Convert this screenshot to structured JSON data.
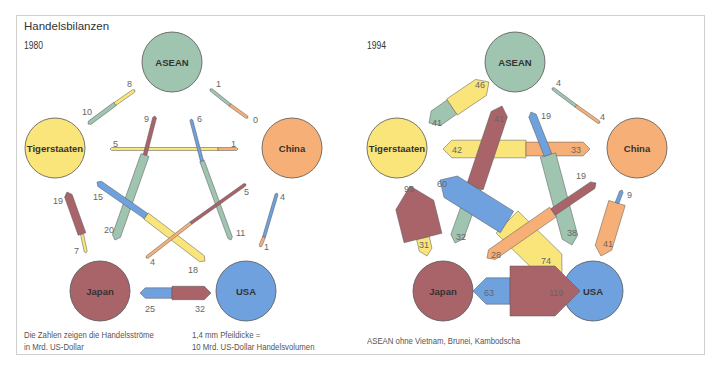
{
  "title": "Handelsbilanzen",
  "colors": {
    "ASEAN": "#9fc4b0",
    "Tigerstaaten": "#f9e57a",
    "China": "#f6b077",
    "Japan": "#a9646a",
    "USA": "#6fa1de",
    "stroke": "#555555",
    "text": "#333333",
    "label": "#666666"
  },
  "panels": [
    {
      "year": "1980",
      "nodes": [
        {
          "name": "ASEAN",
          "x": 172,
          "y": 62,
          "r": 30
        },
        {
          "name": "Tigerstaaten",
          "x": 55,
          "y": 148,
          "r": 30
        },
        {
          "name": "China",
          "x": 292,
          "y": 148,
          "r": 30
        },
        {
          "name": "Japan",
          "x": 100,
          "y": 291,
          "r": 30
        },
        {
          "name": "USA",
          "x": 246,
          "y": 291,
          "r": 30
        }
      ],
      "flows": [
        {
          "from": "ASEAN",
          "to": "Tigerstaaten",
          "value": 10,
          "x1": 88,
          "y1": 124,
          "x2": 115,
          "y2": 104,
          "label_pos": [
            82,
            115
          ]
        },
        {
          "from": "Tigerstaaten",
          "to": "ASEAN",
          "value": 8,
          "x1": 115,
          "y1": 104,
          "x2": 135,
          "y2": 90,
          "label_pos": [
            127,
            87
          ]
        },
        {
          "from": "ASEAN",
          "to": "China",
          "value": 1,
          "x1": 210,
          "y1": 89,
          "x2": 230,
          "y2": 105,
          "label_pos": [
            216,
            87
          ]
        },
        {
          "from": "China",
          "to": "ASEAN",
          "value": 0,
          "x1": 230,
          "y1": 105,
          "x2": 248,
          "y2": 118,
          "label_pos": [
            253,
            123
          ]
        },
        {
          "from": "Tigerstaaten",
          "to": "China",
          "value": 5,
          "x1": 110,
          "y1": 149,
          "x2": 218,
          "y2": 149,
          "label_pos": [
            113,
            147
          ]
        },
        {
          "from": "China",
          "to": "Tigerstaaten",
          "value": 1,
          "x1": 218,
          "y1": 149,
          "x2": 238,
          "y2": 149,
          "label_pos": [
            231,
            147
          ]
        },
        {
          "from": "ASEAN",
          "to": "Japan",
          "value": 20,
          "x1": 115,
          "y1": 240,
          "x2": 145,
          "y2": 155,
          "label_pos": [
            104,
            233
          ]
        },
        {
          "from": "Japan",
          "to": "ASEAN",
          "value": 9,
          "x1": 145,
          "y1": 155,
          "x2": 155,
          "y2": 116,
          "label_pos": [
            144,
            122
          ]
        },
        {
          "from": "ASEAN",
          "to": "USA",
          "value": 11,
          "x1": 231,
          "y1": 240,
          "x2": 202,
          "y2": 161,
          "label_pos": [
            236,
            236
          ]
        },
        {
          "from": "USA",
          "to": "ASEAN",
          "value": 6,
          "x1": 202,
          "y1": 161,
          "x2": 191,
          "y2": 119,
          "label_pos": [
            197,
            122
          ]
        },
        {
          "from": "Tigerstaaten",
          "to": "USA",
          "value": 18,
          "x1": 205,
          "y1": 261,
          "x2": 146,
          "y2": 216,
          "label_pos": [
            188,
            273
          ]
        },
        {
          "from": "USA",
          "to": "Tigerstaaten",
          "value": 15,
          "x1": 146,
          "y1": 216,
          "x2": 97,
          "y2": 182,
          "label_pos": [
            93,
            200
          ]
        },
        {
          "from": "China",
          "to": "Japan",
          "value": 4,
          "x1": 146,
          "y1": 258,
          "x2": 191,
          "y2": 223,
          "label_pos": [
            150,
            265
          ]
        },
        {
          "from": "Japan",
          "to": "China",
          "value": 5,
          "x1": 191,
          "y1": 223,
          "x2": 246,
          "y2": 184,
          "label_pos": [
            244,
            195
          ]
        },
        {
          "from": "Tigerstaaten",
          "to": "Japan",
          "value": 7,
          "x1": 86,
          "y1": 253,
          "x2": 82,
          "y2": 234,
          "label_pos": [
            74,
            254
          ]
        },
        {
          "from": "Japan",
          "to": "Tigerstaaten",
          "value": 19,
          "x1": 82,
          "y1": 234,
          "x2": 67,
          "y2": 192,
          "label_pos": [
            53,
            204
          ]
        },
        {
          "from": "China",
          "to": "USA",
          "value": 1,
          "x1": 260,
          "y1": 247,
          "x2": 264,
          "y2": 237,
          "label_pos": [
            264,
            250
          ]
        },
        {
          "from": "USA",
          "to": "China",
          "value": 4,
          "x1": 264,
          "y1": 237,
          "x2": 277,
          "y2": 193,
          "label_pos": [
            280,
            200
          ]
        },
        {
          "from": "USA",
          "to": "Japan",
          "value": 25,
          "x1": 140,
          "y1": 293,
          "x2": 172,
          "y2": 293,
          "label_pos": [
            145,
            312
          ]
        },
        {
          "from": "Japan",
          "to": "USA",
          "value": 32,
          "x1": 172,
          "y1": 293,
          "x2": 211,
          "y2": 293,
          "label_pos": [
            195,
            312
          ]
        }
      ],
      "notes": [
        {
          "lines": [
            "Die Zahlen zeigen die Handelsströme",
            "in Mrd. US-Dollar"
          ],
          "x": 24,
          "y": 333
        },
        {
          "lines": [
            "1,4 mm Pfeildicke =",
            "10 Mrd. US-Dollar Handelsvolumen"
          ],
          "x": 192,
          "y": 333
        }
      ]
    },
    {
      "year": "1994",
      "nodes": [
        {
          "name": "ASEAN",
          "x": 515,
          "y": 62,
          "r": 30
        },
        {
          "name": "Tigerstaaten",
          "x": 397,
          "y": 148,
          "r": 30
        },
        {
          "name": "China",
          "x": 637,
          "y": 148,
          "r": 30
        },
        {
          "name": "Japan",
          "x": 443,
          "y": 291,
          "r": 30
        },
        {
          "name": "USA",
          "x": 593,
          "y": 291,
          "r": 30
        }
      ],
      "flows": [
        {
          "from": "ASEAN",
          "to": "Tigerstaaten",
          "value": 41,
          "x1": 429,
          "y1": 123,
          "x2": 452,
          "y2": 107,
          "label_pos": [
            432,
            126
          ]
        },
        {
          "from": "Tigerstaaten",
          "to": "ASEAN",
          "value": 46,
          "x1": 452,
          "y1": 107,
          "x2": 489,
          "y2": 82,
          "label_pos": [
            475,
            88
          ]
        },
        {
          "from": "ASEAN",
          "to": "China",
          "value": 4,
          "x1": 552,
          "y1": 88,
          "x2": 576,
          "y2": 106,
          "label_pos": [
            556,
            86
          ]
        },
        {
          "from": "China",
          "to": "ASEAN",
          "value": 4,
          "x1": 576,
          "y1": 106,
          "x2": 600,
          "y2": 123,
          "label_pos": [
            600,
            120
          ]
        },
        {
          "from": "Tigerstaaten",
          "to": "China",
          "value": 42,
          "x1": 443,
          "y1": 149,
          "x2": 526,
          "y2": 149,
          "label_pos": [
            452,
            153
          ]
        },
        {
          "from": "China",
          "to": "Tigerstaaten",
          "value": 33,
          "x1": 526,
          "y1": 149,
          "x2": 590,
          "y2": 149,
          "label_pos": [
            571,
            153
          ]
        },
        {
          "from": "ASEAN",
          "to": "Japan",
          "value": 32,
          "x1": 455,
          "y1": 243,
          "x2": 475,
          "y2": 187,
          "label_pos": [
            456,
            240
          ]
        },
        {
          "from": "Japan",
          "to": "ASEAN",
          "value": 41,
          "x1": 475,
          "y1": 187,
          "x2": 502,
          "y2": 106,
          "label_pos": [
            494,
            122
          ]
        },
        {
          "from": "ASEAN",
          "to": "USA",
          "value": 38,
          "x1": 572,
          "y1": 245,
          "x2": 548,
          "y2": 155,
          "label_pos": [
            567,
            236
          ]
        },
        {
          "from": "USA",
          "to": "ASEAN",
          "value": 19,
          "x1": 548,
          "y1": 155,
          "x2": 531,
          "y2": 112,
          "label_pos": [
            541,
            119
          ]
        },
        {
          "from": "Tigerstaaten",
          "to": "USA",
          "value": 74,
          "x1": 562,
          "y1": 276,
          "x2": 507,
          "y2": 222,
          "label_pos": [
            541,
            264
          ]
        },
        {
          "from": "USA",
          "to": "Tigerstaaten",
          "value": 60,
          "x1": 507,
          "y1": 222,
          "x2": 440,
          "y2": 180,
          "label_pos": [
            437,
            187
          ]
        },
        {
          "from": "China",
          "to": "Japan",
          "value": 28,
          "x1": 487,
          "y1": 258,
          "x2": 553,
          "y2": 212,
          "label_pos": [
            491,
            258
          ]
        },
        {
          "from": "Japan",
          "to": "China",
          "value": 19,
          "x1": 553,
          "y1": 212,
          "x2": 596,
          "y2": 183,
          "label_pos": [
            576,
            179
          ]
        },
        {
          "from": "Tigerstaaten",
          "to": "Japan",
          "value": 31,
          "x1": 427,
          "y1": 256,
          "x2": 423,
          "y2": 238,
          "label_pos": [
            419,
            248
          ]
        },
        {
          "from": "Japan",
          "to": "Tigerstaaten",
          "value": 93,
          "x1": 423,
          "y1": 238,
          "x2": 410,
          "y2": 186,
          "label_pos": [
            404,
            192
          ]
        },
        {
          "from": "China",
          "to": "USA",
          "value": 41,
          "x1": 601,
          "y1": 256,
          "x2": 617,
          "y2": 203,
          "label_pos": [
            603,
            247
          ]
        },
        {
          "from": "USA",
          "to": "China",
          "value": 9,
          "x1": 617,
          "y1": 203,
          "x2": 622,
          "y2": 190,
          "label_pos": [
            627,
            198
          ]
        },
        {
          "from": "USA",
          "to": "Japan",
          "value": 63,
          "x1": 473,
          "y1": 291,
          "x2": 510,
          "y2": 291,
          "label_pos": [
            484,
            296
          ]
        },
        {
          "from": "Japan",
          "to": "USA",
          "value": 119,
          "x1": 510,
          "y1": 291,
          "x2": 580,
          "y2": 291,
          "label_pos": [
            549,
            296
          ]
        }
      ],
      "notes": [
        {
          "lines": [
            "ASEAN ohne Vietnam, Brunei, Kambodscha"
          ],
          "x": 367,
          "y": 341
        }
      ]
    }
  ]
}
